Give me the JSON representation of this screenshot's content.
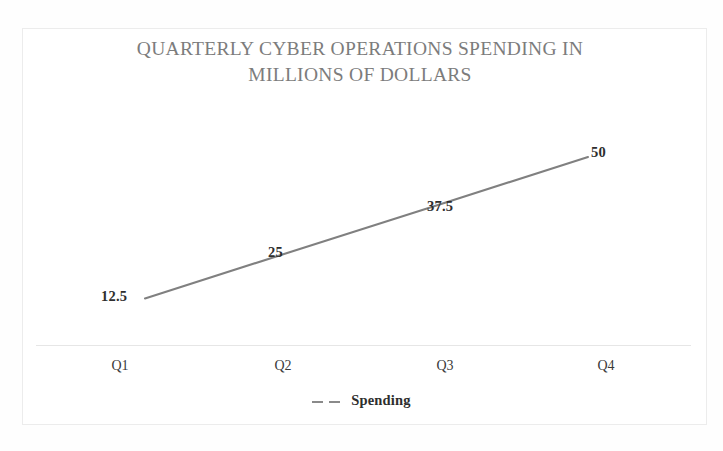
{
  "chart_data": {
    "type": "line",
    "title": "QUARTERLY CYBER OPERATIONS SPENDING IN\nMILLIONS OF DOLLARS",
    "xlabel": "",
    "ylabel": "",
    "categories": [
      "Q1",
      "Q2",
      "Q3",
      "Q4"
    ],
    "series": [
      {
        "name": "Spending",
        "values": [
          12.5,
          25,
          37.5,
          50
        ],
        "value_labels": [
          "12.5",
          "25",
          "37.5",
          "50"
        ],
        "line_style": "dashed",
        "color": "#808080",
        "markers": false
      }
    ],
    "ylim": [
      0,
      56
    ],
    "grid": false,
    "axis_line": true,
    "legend": {
      "position": "bottom",
      "entries": [
        {
          "label": "Spending",
          "marker": "dashed-line-icon",
          "color": "#8a8a8a"
        }
      ]
    },
    "colors": {
      "title": "#7c7c7c",
      "series_line": "#808080",
      "data_label": "#2e2e2e",
      "category_label": "#3a3a3a",
      "axis_line": "#e4e4e4",
      "frame_border": "#ececec",
      "background": "#ffffff"
    }
  }
}
